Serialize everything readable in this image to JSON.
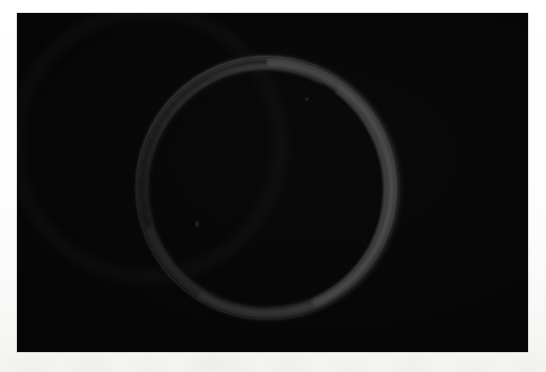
{
  "page": {
    "kind": "scanned-photograph",
    "background_color": "#fdfdfd",
    "width": 546,
    "height": 372
  },
  "photo": {
    "caption": "",
    "background_color": "#050505",
    "frame": {
      "x": 17,
      "y": 13,
      "width": 511,
      "height": 339
    },
    "subject": {
      "name": "ring",
      "description": "dark circular band",
      "center": {
        "x": 268,
        "y": 188
      },
      "outer_radius": 131,
      "inner_radius": 120,
      "band_thickness_min": 8,
      "band_thickness_max": 14,
      "colors": {
        "brightest_arc": "#4e4e4e",
        "mid_arc": "#3a3a3a",
        "dimmest_arc": "#262626",
        "shadow_edge": "#111111"
      },
      "highlight_direction": "upper-right"
    },
    "artifacts": [
      {
        "name": "dust-speck",
        "x": 197,
        "y": 224
      },
      {
        "name": "dust-speck",
        "x": 307,
        "y": 100
      }
    ]
  },
  "margin": {
    "has_scan_noise": true,
    "noise_region": {
      "x": 0,
      "y": 354,
      "width": 546,
      "height": 18
    }
  }
}
